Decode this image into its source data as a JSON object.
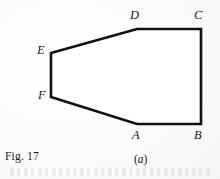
{
  "figure": {
    "fig_number": "Fig. 17",
    "panel_label_open": "(",
    "panel_label_letter": "a",
    "panel_label_close": ")",
    "stroke_color": "#111111",
    "fill_color": "#ffffff",
    "background_color": "#fdfdfc",
    "stroke_width": 2.6
  },
  "shape": {
    "name": "hexagon-ABCDEF",
    "path": "M 137,124 L 201,124 L 201,29 L 137,29 L 51,53 L 51,97 Z",
    "vertices": [
      {
        "id": "A",
        "label": "A",
        "x": 137,
        "y": 124,
        "label_x": 132,
        "label_y": 129
      },
      {
        "id": "B",
        "label": "B",
        "x": 201,
        "y": 124,
        "label_x": 194,
        "label_y": 129
      },
      {
        "id": "C",
        "label": "C",
        "x": 201,
        "y": 29,
        "label_x": 194,
        "label_y": 9
      },
      {
        "id": "D",
        "label": "D",
        "x": 137,
        "y": 29,
        "label_x": 130,
        "label_y": 9
      },
      {
        "id": "E",
        "label": "E",
        "x": 51,
        "y": 53,
        "label_x": 37,
        "label_y": 44
      },
      {
        "id": "F",
        "label": "F",
        "x": 51,
        "y": 97,
        "label_x": 38,
        "label_y": 89
      }
    ],
    "edges": [
      {
        "from": "A",
        "to": "B"
      },
      {
        "from": "B",
        "to": "C"
      },
      {
        "from": "C",
        "to": "D"
      },
      {
        "from": "D",
        "to": "E"
      },
      {
        "from": "E",
        "to": "F"
      },
      {
        "from": "F",
        "to": "A"
      }
    ]
  }
}
